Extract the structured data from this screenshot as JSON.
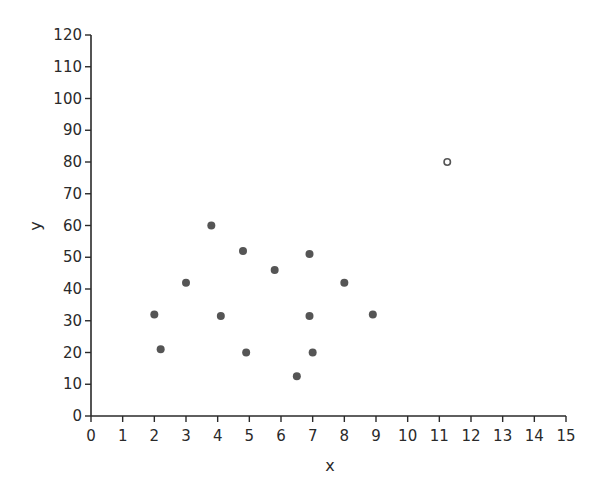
{
  "chart_data": {
    "type": "scatter",
    "values_are_estimated": true,
    "estimation_note": "Point coordinates are approximate, estimated from pixel positions against the axis ticks. The chart itself prints no data values.",
    "title": "",
    "xlabel": "x",
    "ylabel": "y",
    "xlim": [
      0,
      15
    ],
    "ylim": [
      0,
      120
    ],
    "x_ticks": [
      0,
      1,
      2,
      3,
      4,
      5,
      6,
      7,
      8,
      9,
      10,
      11,
      12,
      13,
      14,
      15
    ],
    "y_ticks": [
      0,
      10,
      20,
      30,
      40,
      50,
      60,
      70,
      80,
      90,
      100,
      110,
      120
    ],
    "grid": false,
    "legend": null,
    "series": [
      {
        "name": "data",
        "marker": "filled-circle",
        "color": "#555555",
        "points": [
          {
            "x": 2.0,
            "y": 32
          },
          {
            "x": 2.2,
            "y": 21
          },
          {
            "x": 3.0,
            "y": 42
          },
          {
            "x": 3.8,
            "y": 60
          },
          {
            "x": 4.1,
            "y": 31.5
          },
          {
            "x": 4.8,
            "y": 52
          },
          {
            "x": 4.9,
            "y": 20
          },
          {
            "x": 5.8,
            "y": 46
          },
          {
            "x": 6.5,
            "y": 12.5
          },
          {
            "x": 6.9,
            "y": 51
          },
          {
            "x": 6.9,
            "y": 31.5
          },
          {
            "x": 7.0,
            "y": 20
          },
          {
            "x": 8.0,
            "y": 42
          },
          {
            "x": 8.9,
            "y": 32
          }
        ]
      },
      {
        "name": "outlier",
        "marker": "hollow-circle",
        "color": "#555555",
        "points": [
          {
            "x": 11.25,
            "y": 80
          }
        ]
      }
    ]
  }
}
